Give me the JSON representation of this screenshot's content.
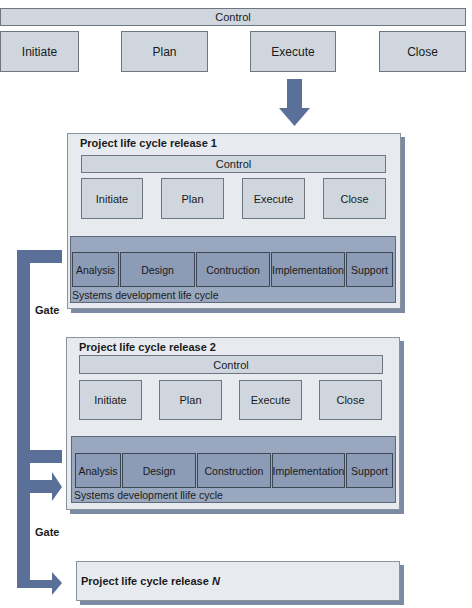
{
  "colors": {
    "arrow": "#5a7099",
    "phase_fill": "#cfd6de",
    "release_fill": "#e7ebf0",
    "sdlc_fill": "#9aa8bf",
    "sdlc_box_fill": "#8c9bb6"
  },
  "top": {
    "control": "Control",
    "phases": [
      "Initiate",
      "Plan",
      "Execute",
      "Close"
    ]
  },
  "releases": [
    {
      "title": "Project life cycle release 1",
      "control": "Control",
      "phases": [
        "Initiate",
        "Plan",
        "Execute",
        "Close"
      ],
      "sdlc": {
        "stages": [
          "Analysis",
          "Design",
          "Contruction",
          "Implementation",
          "Support"
        ],
        "label": "Systems development life cycle"
      }
    },
    {
      "title": "Project life cycle release 2",
      "control": "Control",
      "phases": [
        "Initiate",
        "Plan",
        "Execute",
        "Close"
      ],
      "sdlc": {
        "stages": [
          "Analysis",
          "Design",
          "Construction",
          "Implementation",
          "Support"
        ],
        "label": "Systems development llife cycle"
      }
    }
  ],
  "release_n": {
    "title_prefix": "Project life cycle release ",
    "title_var": "N"
  },
  "gates": [
    "Gate",
    "Gate"
  ],
  "icons": {
    "down_arrow": "down-arrow-icon",
    "gate_arrow": "bracket-arrow-icon"
  }
}
